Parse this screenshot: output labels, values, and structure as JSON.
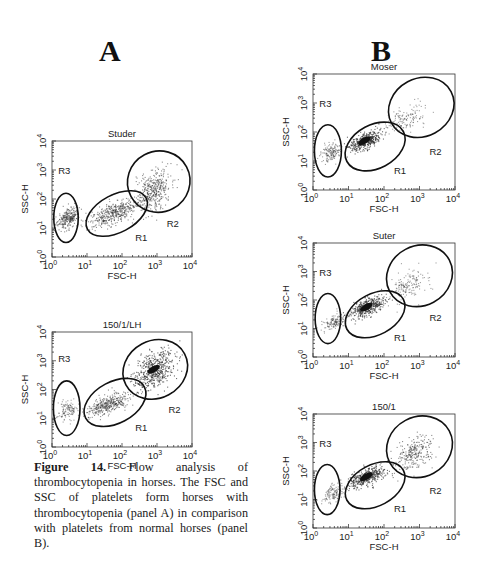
{
  "figure": {
    "panels": [
      {
        "letter": "A"
      },
      {
        "letter": "B"
      }
    ],
    "caption": {
      "label": "Figure 14.",
      "text": " Flow analysis of thrombocytopenia in horses. The FSC and SSC of platelets form horses with thrombocytopenia (panel A) in comparison with platelets from normal horses (panel B)."
    }
  },
  "chart_data": [
    {
      "type": "scatter",
      "panel": "A",
      "title": "Studer",
      "xlabel": "FSC-H",
      "ylabel": "SSC-H",
      "x_scale": "log",
      "y_scale": "log",
      "xlim": [
        1,
        10000
      ],
      "ylim": [
        1,
        10000
      ],
      "x_ticks": [
        "10^0",
        "10^1",
        "10^2",
        "10^3",
        "10^4"
      ],
      "y_ticks": [
        "10^0",
        "10^1",
        "10^2",
        "10^3",
        "10^4"
      ],
      "gates": [
        {
          "name": "R1",
          "label_pos": [
            2.55,
            0.55
          ],
          "shape": "ellipse",
          "center_log": [
            1.85,
            1.5
          ],
          "rx_log": 0.95,
          "ry_log": 0.65
        },
        {
          "name": "R2",
          "label_pos": [
            3.45,
            1.05
          ],
          "shape": "ellipse",
          "center_log": [
            3.05,
            2.6
          ],
          "rx_log": 0.9,
          "ry_log": 1.05
        },
        {
          "name": "R3",
          "label_pos": [
            0.35,
            2.85
          ],
          "shape": "ellipse",
          "center_log": [
            0.4,
            1.35
          ],
          "rx_log": 0.35,
          "ry_log": 0.85
        }
      ],
      "populations": [
        {
          "center_log": [
            0.45,
            1.35
          ],
          "spread": [
            0.22,
            0.3
          ],
          "count": 260,
          "density": "medium"
        },
        {
          "center_log": [
            1.8,
            1.55
          ],
          "spread": [
            0.55,
            0.3
          ],
          "count": 420,
          "density": "medium"
        },
        {
          "center_log": [
            2.9,
            2.3
          ],
          "spread": [
            0.35,
            0.55
          ],
          "count": 380,
          "density": "medium"
        }
      ]
    },
    {
      "type": "scatter",
      "panel": "A",
      "title": "150/1/LH",
      "xlabel": "FSC-H",
      "ylabel": "SSC-H",
      "x_scale": "log",
      "y_scale": "log",
      "xlim": [
        1,
        10000
      ],
      "ylim": [
        1,
        10000
      ],
      "x_ticks": [
        "10^0",
        "10^1",
        "10^2",
        "10^3",
        "10^4"
      ],
      "y_ticks": [
        "10^0",
        "10^1",
        "10^2",
        "10^3",
        "10^4"
      ],
      "gates": [
        {
          "name": "R1",
          "label_pos": [
            2.55,
            0.55
          ],
          "shape": "ellipse",
          "center_log": [
            1.8,
            1.55
          ],
          "rx_log": 0.95,
          "ry_log": 0.72
        },
        {
          "name": "R2",
          "label_pos": [
            3.5,
            1.2
          ],
          "shape": "ellipse",
          "center_log": [
            2.95,
            2.7
          ],
          "rx_log": 0.95,
          "ry_log": 1.0
        },
        {
          "name": "R3",
          "label_pos": [
            0.35,
            2.95
          ],
          "shape": "ellipse",
          "center_log": [
            0.42,
            1.35
          ],
          "rx_log": 0.38,
          "ry_log": 0.95
        }
      ],
      "populations": [
        {
          "center_log": [
            0.45,
            1.3
          ],
          "spread": [
            0.2,
            0.3
          ],
          "count": 120,
          "density": "low"
        },
        {
          "center_log": [
            1.6,
            1.5
          ],
          "spread": [
            0.5,
            0.25
          ],
          "count": 360,
          "density": "medium"
        },
        {
          "center_log": [
            2.9,
            2.7
          ],
          "spread": [
            0.4,
            0.5
          ],
          "count": 520,
          "density": "high"
        }
      ]
    },
    {
      "type": "scatter",
      "panel": "B",
      "title": "Moser",
      "xlabel": "FSC-H",
      "ylabel": "SSC-H",
      "x_scale": "log",
      "y_scale": "log",
      "xlim": [
        1,
        10000
      ],
      "ylim": [
        1,
        10000
      ],
      "x_ticks": [
        "10^0",
        "10^1",
        "10^2",
        "10^3",
        "10^4"
      ],
      "y_ticks": [
        "10^0",
        "10^1",
        "10^2",
        "10^3",
        "10^4"
      ],
      "gates": [
        {
          "name": "R1",
          "label_pos": [
            2.45,
            0.55
          ],
          "shape": "ellipse",
          "center_log": [
            1.75,
            1.5
          ],
          "rx_log": 0.9,
          "ry_log": 0.75
        },
        {
          "name": "R2",
          "label_pos": [
            3.45,
            1.2
          ],
          "shape": "ellipse",
          "center_log": [
            3.05,
            2.85
          ],
          "rx_log": 0.95,
          "ry_log": 1.0
        },
        {
          "name": "R3",
          "label_pos": [
            0.35,
            2.85
          ],
          "shape": "ellipse",
          "center_log": [
            0.42,
            1.35
          ],
          "rx_log": 0.38,
          "ry_log": 0.9
        }
      ],
      "populations": [
        {
          "center_log": [
            0.5,
            1.3
          ],
          "spread": [
            0.2,
            0.25
          ],
          "count": 150,
          "density": "low"
        },
        {
          "center_log": [
            1.45,
            1.7
          ],
          "spread": [
            0.35,
            0.22
          ],
          "count": 420,
          "density": "high"
        },
        {
          "center_log": [
            2.6,
            2.5
          ],
          "spread": [
            0.45,
            0.4
          ],
          "count": 140,
          "density": "low"
        }
      ]
    },
    {
      "type": "scatter",
      "panel": "B",
      "title": "Suter",
      "xlabel": "FSC-H",
      "ylabel": "SSC-H",
      "x_scale": "log",
      "y_scale": "log",
      "xlim": [
        1,
        10000
      ],
      "ylim": [
        1,
        10000
      ],
      "x_ticks": [
        "10^0",
        "10^1",
        "10^2",
        "10^3",
        "10^4"
      ],
      "y_ticks": [
        "10^0",
        "10^1",
        "10^2",
        "10^3",
        "10^4"
      ],
      "gates": [
        {
          "name": "R1",
          "label_pos": [
            2.45,
            0.55
          ],
          "shape": "ellipse",
          "center_log": [
            1.75,
            1.5
          ],
          "rx_log": 0.9,
          "ry_log": 0.72
        },
        {
          "name": "R2",
          "label_pos": [
            3.45,
            1.25
          ],
          "shape": "ellipse",
          "center_log": [
            3.0,
            2.85
          ],
          "rx_log": 0.95,
          "ry_log": 1.05
        },
        {
          "name": "R3",
          "label_pos": [
            0.35,
            2.85
          ],
          "shape": "ellipse",
          "center_log": [
            0.42,
            1.35
          ],
          "rx_log": 0.36,
          "ry_log": 0.88
        }
      ],
      "populations": [
        {
          "center_log": [
            0.6,
            1.25
          ],
          "spread": [
            0.25,
            0.22
          ],
          "count": 140,
          "density": "low"
        },
        {
          "center_log": [
            1.5,
            1.75
          ],
          "spread": [
            0.4,
            0.25
          ],
          "count": 400,
          "density": "high"
        },
        {
          "center_log": [
            2.7,
            2.55
          ],
          "spread": [
            0.45,
            0.45
          ],
          "count": 160,
          "density": "low"
        }
      ]
    },
    {
      "type": "scatter",
      "panel": "B",
      "title": "150/1",
      "xlabel": "FSC-H",
      "ylabel": "SSC-H",
      "x_scale": "log",
      "y_scale": "log",
      "xlim": [
        1,
        10000
      ],
      "ylim": [
        1,
        10000
      ],
      "x_ticks": [
        "10^0",
        "10^1",
        "10^2",
        "10^3",
        "10^4"
      ],
      "y_ticks": [
        "10^0",
        "10^1",
        "10^2",
        "10^3",
        "10^4"
      ],
      "gates": [
        {
          "name": "R1",
          "label_pos": [
            2.45,
            0.55
          ],
          "shape": "ellipse",
          "center_log": [
            1.75,
            1.5
          ],
          "rx_log": 0.9,
          "ry_log": 0.72
        },
        {
          "name": "R2",
          "label_pos": [
            3.45,
            1.2
          ],
          "shape": "ellipse",
          "center_log": [
            3.0,
            2.85
          ],
          "rx_log": 0.95,
          "ry_log": 1.05
        },
        {
          "name": "R3",
          "label_pos": [
            0.35,
            2.85
          ],
          "shape": "ellipse",
          "center_log": [
            0.4,
            1.35
          ],
          "rx_log": 0.36,
          "ry_log": 0.88
        }
      ],
      "populations": [
        {
          "center_log": [
            0.55,
            1.2
          ],
          "spread": [
            0.22,
            0.25
          ],
          "count": 130,
          "density": "low"
        },
        {
          "center_log": [
            1.5,
            1.8
          ],
          "spread": [
            0.4,
            0.25
          ],
          "count": 420,
          "density": "high"
        },
        {
          "center_log": [
            2.8,
            2.6
          ],
          "spread": [
            0.4,
            0.45
          ],
          "count": 260,
          "density": "medium"
        }
      ]
    }
  ]
}
